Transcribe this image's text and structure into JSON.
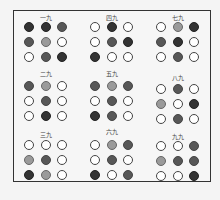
{
  "diagram": {
    "legend_shades": {
      "0": "white",
      "1": "light-gray",
      "2": "dark-gray",
      "3": "black"
    },
    "groups": [
      {
        "title": "一九",
        "x": 19,
        "y": 14,
        "title_y": 0,
        "dots_y": 8,
        "rows": [
          [
            3,
            3,
            2
          ],
          [
            2,
            1,
            0
          ],
          [
            0,
            2,
            3
          ]
        ]
      },
      {
        "title": "四九",
        "x": 85,
        "y": 14,
        "title_y": 0,
        "dots_y": 8,
        "rows": [
          [
            0,
            3,
            0
          ],
          [
            0,
            2,
            3
          ],
          [
            3,
            0,
            0
          ]
        ]
      },
      {
        "title": "七九",
        "x": 151,
        "y": 14,
        "title_y": 0,
        "dots_y": 8,
        "rows": [
          [
            0,
            1,
            3
          ],
          [
            2,
            3,
            0
          ],
          [
            0,
            2,
            0
          ]
        ]
      },
      {
        "title": "二九",
        "x": 19,
        "y": 70,
        "title_y": 0,
        "dots_y": 11,
        "rows": [
          [
            2,
            1,
            0
          ],
          [
            0,
            2,
            0
          ],
          [
            0,
            3,
            0
          ]
        ]
      },
      {
        "title": "五九",
        "x": 85,
        "y": 70,
        "title_y": 0,
        "dots_y": 11,
        "rows": [
          [
            2,
            1,
            2
          ],
          [
            0,
            2,
            0
          ],
          [
            3,
            2,
            0
          ]
        ]
      },
      {
        "title": "八九",
        "x": 151,
        "y": 74,
        "title_y": 0,
        "dots_y": 10,
        "rows": [
          [
            0,
            2,
            0
          ],
          [
            1,
            0,
            3
          ],
          [
            0,
            2,
            0
          ]
        ]
      },
      {
        "title": "三九",
        "x": 19,
        "y": 131,
        "title_y": 0,
        "dots_y": 9,
        "rows": [
          [
            0,
            0,
            0
          ],
          [
            1,
            2,
            0
          ],
          [
            3,
            1,
            0
          ]
        ]
      },
      {
        "title": "六九",
        "x": 85,
        "y": 128,
        "title_y": 0,
        "dots_y": 12,
        "rows": [
          [
            0,
            1,
            2
          ],
          [
            0,
            2,
            0
          ],
          [
            3,
            0,
            2
          ]
        ]
      },
      {
        "title": "九九",
        "x": 151,
        "y": 133,
        "title_y": 0,
        "dots_y": 8,
        "rows": [
          [
            0,
            0,
            2
          ],
          [
            1,
            2,
            2
          ],
          [
            0,
            0,
            3
          ]
        ]
      }
    ]
  }
}
